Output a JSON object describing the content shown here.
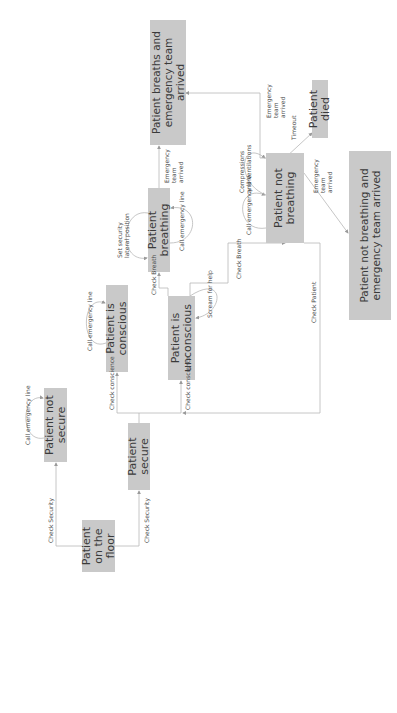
{
  "diagram": {
    "title": "",
    "orientation": "rotated -90deg",
    "colors": {
      "node_fill": "#c9c9c9",
      "node_text": "#3a3a3a",
      "edge": "#b8b8b8",
      "label": "#4a4a4a",
      "background": "#ffffff"
    },
    "nodes": [
      {
        "id": "floor",
        "label": "Patient on the floor"
      },
      {
        "id": "not_secure",
        "label": "Patient not secure"
      },
      {
        "id": "secure",
        "label": "Patient secure"
      },
      {
        "id": "conscious",
        "label": "Patient is conscious"
      },
      {
        "id": "unconscious",
        "label": "Patient is unconscious"
      },
      {
        "id": "breathing",
        "label": "Patient breathing"
      },
      {
        "id": "breaths_team",
        "label": "Patient breaths and emergency team arrived"
      },
      {
        "id": "not_breathing",
        "label": "Patient not breathing"
      },
      {
        "id": "died",
        "label": "Patient died"
      },
      {
        "id": "not_breathing_team",
        "label": "Patient not breathing and emergency team arrived"
      }
    ],
    "edges": [
      {
        "from": "floor",
        "to": "not_secure",
        "label": "Check Security"
      },
      {
        "from": "floor",
        "to": "secure",
        "label": "Check Security"
      },
      {
        "from": "not_secure",
        "to": "not_secure",
        "label": "Call emergency line"
      },
      {
        "from": "secure",
        "to": "conscious",
        "label": "Check conscience"
      },
      {
        "from": "secure",
        "to": "unconscious",
        "label": "Check conscience"
      },
      {
        "from": "conscious",
        "to": "conscious",
        "label": "Call emergency line"
      },
      {
        "from": "unconscious",
        "to": "breathing",
        "label": "Check Breath"
      },
      {
        "from": "unconscious",
        "to": "unconscious",
        "label": "Scream for help"
      },
      {
        "from": "unconscious",
        "to": "not_breathing",
        "label": "Check Breath"
      },
      {
        "from": "breathing",
        "to": "breathing",
        "label": "Set security lateral position"
      },
      {
        "from": "breathing",
        "to": "breathing",
        "label": "Call emergency line"
      },
      {
        "from": "breathing",
        "to": "breaths_team",
        "label": "Emergency team arrived"
      },
      {
        "from": "not_breathing",
        "to": "not_breathing",
        "label": "Call emergency line"
      },
      {
        "from": "not_breathing",
        "to": "not_breathing",
        "label": "Compressions and Ventilations"
      },
      {
        "from": "not_breathing",
        "to": "breaths_team",
        "label": "Emergency team arrived"
      },
      {
        "from": "not_breathing",
        "to": "died",
        "label": "Timeout"
      },
      {
        "from": "not_breathing",
        "to": "not_breathing_team",
        "label": "Emergency team arrived"
      },
      {
        "from": "not_breathing",
        "to": "secure",
        "label": "Check Patient"
      }
    ]
  }
}
